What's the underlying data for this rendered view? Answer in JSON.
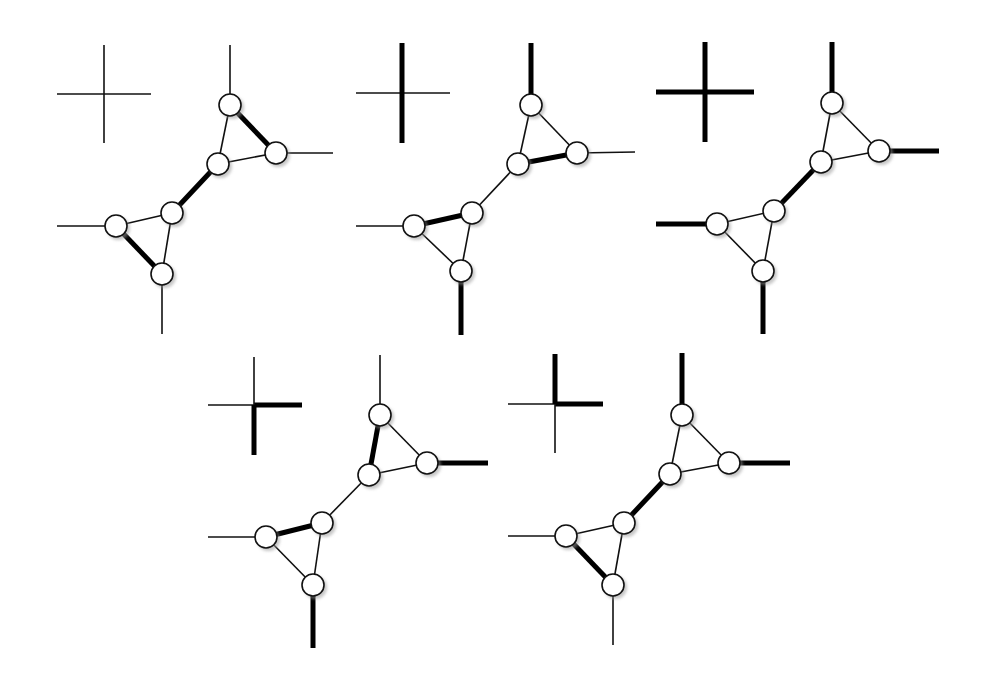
{
  "diagram": {
    "colors": {
      "background": "#ffffff",
      "line": "#000000",
      "node_fill": "#ffffff",
      "node_shadow": "#9a9a9a"
    },
    "node_radius": 11,
    "panels": [
      {
        "id": "panel-1",
        "cross": {
          "center": [
            104,
            94
          ],
          "left": 57,
          "right": 151,
          "top": 45,
          "bottom": 143,
          "bold": {
            "left": false,
            "right": false,
            "top": false,
            "bottom": false
          }
        },
        "nodes": {
          "top": [
            230,
            105
          ],
          "right": [
            276,
            153
          ],
          "midTop": [
            218,
            164
          ],
          "midBottom": [
            172,
            213
          ],
          "left": [
            116,
            226
          ],
          "bottom": [
            162,
            274
          ]
        },
        "externals": {
          "top": [
            230,
            45
          ],
          "right": [
            333,
            153
          ],
          "left": [
            57,
            226
          ],
          "bottom": [
            162,
            334
          ]
        },
        "bold_externals": {
          "top": false,
          "right": false,
          "left": false,
          "bottom": false
        },
        "bold_edges": [
          "top-right",
          "bridge",
          "left-bottom"
        ]
      },
      {
        "id": "panel-2",
        "cross": {
          "center": [
            402,
            93
          ],
          "left": 356,
          "right": 450,
          "top": 43,
          "bottom": 143,
          "bold": {
            "left": false,
            "right": false,
            "top": true,
            "bottom": true
          }
        },
        "nodes": {
          "top": [
            531,
            105
          ],
          "right": [
            577,
            153
          ],
          "midTop": [
            518,
            164
          ],
          "midBottom": [
            472,
            213
          ],
          "left": [
            414,
            226
          ],
          "bottom": [
            461,
            271
          ]
        },
        "externals": {
          "top": [
            531,
            43
          ],
          "right": [
            635,
            152
          ],
          "left": [
            356,
            226
          ],
          "bottom": [
            461,
            335
          ]
        },
        "bold_externals": {
          "top": true,
          "right": false,
          "left": false,
          "bottom": true
        },
        "bold_edges": [
          "midTop-right",
          "left-midBottom"
        ]
      },
      {
        "id": "panel-3",
        "cross": {
          "center": [
            705,
            92
          ],
          "left": 656,
          "right": 754,
          "top": 42,
          "bottom": 142,
          "bold": {
            "left": true,
            "right": true,
            "top": true,
            "bottom": true
          }
        },
        "nodes": {
          "top": [
            832,
            103
          ],
          "right": [
            879,
            151
          ],
          "midTop": [
            821,
            162
          ],
          "midBottom": [
            774,
            211
          ],
          "left": [
            717,
            224
          ],
          "bottom": [
            763,
            271
          ]
        },
        "externals": {
          "top": [
            832,
            42
          ],
          "right": [
            939,
            151
          ],
          "left": [
            656,
            224
          ],
          "bottom": [
            763,
            334
          ]
        },
        "bold_externals": {
          "top": true,
          "right": true,
          "left": true,
          "bottom": true
        },
        "bold_edges": [
          "bridge"
        ]
      },
      {
        "id": "panel-4",
        "cross": {
          "center": [
            254,
            405
          ],
          "left": 208,
          "right": 302,
          "top": 357,
          "bottom": 455,
          "bold": {
            "left": false,
            "right": true,
            "top": false,
            "bottom": true
          }
        },
        "nodes": {
          "top": [
            380,
            415
          ],
          "right": [
            427,
            463
          ],
          "midTop": [
            369,
            475
          ],
          "midBottom": [
            322,
            523
          ],
          "left": [
            266,
            537
          ],
          "bottom": [
            313,
            585
          ]
        },
        "externals": {
          "top": [
            380,
            355
          ],
          "right": [
            488,
            463
          ],
          "left": [
            208,
            537
          ],
          "bottom": [
            313,
            648
          ]
        },
        "bold_externals": {
          "top": false,
          "right": true,
          "left": false,
          "bottom": true
        },
        "bold_edges": [
          "top-midTop",
          "left-midBottom"
        ]
      },
      {
        "id": "panel-5",
        "cross": {
          "center": [
            555,
            404
          ],
          "left": 508,
          "right": 603,
          "top": 354,
          "bottom": 453,
          "bold": {
            "left": false,
            "right": true,
            "top": true,
            "bottom": false
          }
        },
        "nodes": {
          "top": [
            682,
            415
          ],
          "right": [
            729,
            463
          ],
          "midTop": [
            670,
            474
          ],
          "midBottom": [
            624,
            523
          ],
          "left": [
            566,
            536
          ],
          "bottom": [
            613,
            585
          ]
        },
        "externals": {
          "top": [
            682,
            353
          ],
          "right": [
            790,
            463
          ],
          "left": [
            508,
            536
          ],
          "bottom": [
            613,
            645
          ]
        },
        "bold_externals": {
          "top": true,
          "right": true,
          "left": false,
          "bottom": false
        },
        "bold_edges": [
          "bridge",
          "left-bottom"
        ]
      }
    ]
  }
}
